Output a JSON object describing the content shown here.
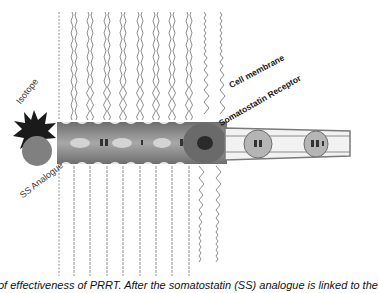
{
  "figure": {
    "labels": {
      "isotope": "Isotope",
      "ss_analogue": "SS Analogue",
      "cell_membrane": "Cell membrane",
      "somatostatin_receptor": "Somatostatin Receptor"
    },
    "caption": "of effectiveness of PRRT. After the somatostatin (SS) analogue is linked to the",
    "colors": {
      "isotope_star": "#1a1a1a",
      "ss_circle": "#808080",
      "membrane_band": "#8c8c8c",
      "lipid_tail": "#9a9a9a",
      "receptor": "#7a7a7a",
      "background": "#ffffff"
    },
    "membrane_columns_x": [
      59,
      74,
      90,
      107,
      123,
      140,
      156,
      172,
      189,
      204,
      220
    ]
  }
}
